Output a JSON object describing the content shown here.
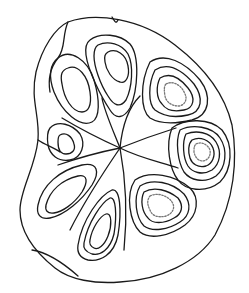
{
  "figure": {
    "colors": {
      "background": "#ffffff",
      "line": "#1a1a1a",
      "dotted_line": "#777777"
    },
    "lobe_count": 8,
    "nodal_center": [
      120,
      148
    ]
  }
}
